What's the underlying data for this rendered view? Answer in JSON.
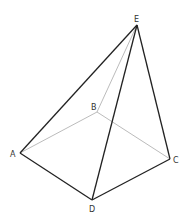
{
  "diagram": {
    "type": "pyramid",
    "colors": {
      "visible_edge": "#222222",
      "hidden_edge": "#aaaaaa",
      "label": "#333333"
    },
    "vertices": {
      "A": {
        "label": "A",
        "x": 20,
        "y": 153
      },
      "B": {
        "label": "B",
        "x": 97,
        "y": 112
      },
      "C": {
        "label": "C",
        "x": 170,
        "y": 159
      },
      "D": {
        "label": "D",
        "x": 92,
        "y": 200
      },
      "E": {
        "label": "E",
        "x": 137,
        "y": 25
      }
    },
    "visible_edges": [
      [
        "A",
        "D"
      ],
      [
        "D",
        "C"
      ],
      [
        "A",
        "E"
      ],
      [
        "D",
        "E"
      ],
      [
        "C",
        "E"
      ]
    ],
    "hidden_edges": [
      [
        "A",
        "B"
      ],
      [
        "B",
        "C"
      ],
      [
        "B",
        "E"
      ]
    ]
  }
}
